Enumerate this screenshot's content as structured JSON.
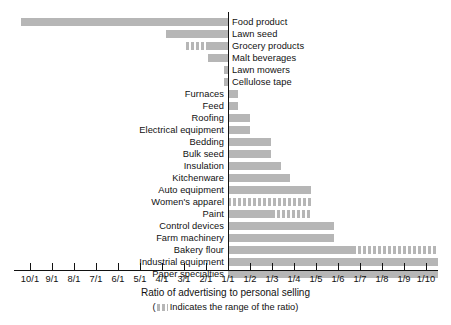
{
  "chart_data": {
    "type": "bar",
    "title": "",
    "xlabel": "Ratio of advertising to personal selling",
    "sublabel_prefix": "(",
    "sublabel_text": "Indicates the range of the ratio)",
    "ylabel": "",
    "orientation": "horizontal",
    "grid": false,
    "legend": "none",
    "axis_note": "Diverging horizontal bars about a central 1/1 axis; bars left of center indicate advertising-heavy ratios (n/1), bars right of center indicate selling-heavy ratios (1/n).",
    "xlim": [
      -10,
      10
    ],
    "tick_labels": [
      "10/1",
      "9/1",
      "8/1",
      "7/1",
      "6/1",
      "5/1",
      "4/1",
      "3/1",
      "2/1",
      "1/1",
      "1/2",
      "1/3",
      "1/4",
      "1/5",
      "1/6",
      "1/7",
      "1/8",
      "1/9",
      "1/10"
    ],
    "tick_values": [
      -10,
      -9,
      -8,
      -7,
      -6,
      -5,
      -4,
      -3,
      -2,
      1,
      2,
      3,
      4,
      5,
      6,
      7,
      8,
      9,
      10
    ],
    "series_name": "Ratio of advertising to personal selling",
    "colors": {
      "bar": "#b6b6b6",
      "axis": "#111111",
      "text": "#111111",
      "background": "#ffffff"
    },
    "categories": [
      "Food product",
      "Lawn seed",
      "Grocery products",
      "Malt beverages",
      "Lawn mowers",
      "Cellulose tape",
      "Furnaces",
      "Feed",
      "Roofing",
      "Electrical equipment",
      "Bedding",
      "Bulk seed",
      "Insulation",
      "Kitchenware",
      "Auto equipment",
      "Women's apparel",
      "Paint",
      "Control devices",
      "Farm machinery",
      "Bakery flour",
      "Industrial equipment",
      "Paper specialties"
    ],
    "bars": [
      {
        "category": "Food product",
        "side": "left",
        "label_position": "right",
        "value_label": "9.4/1",
        "px_start": 21,
        "px_end": 228,
        "segments": [
          {
            "style": "solid",
            "px_start": 21,
            "px_end": 228
          }
        ]
      },
      {
        "category": "Lawn seed",
        "side": "left",
        "label_position": "right",
        "value_label": "2.6/1",
        "px_start": 166,
        "px_end": 228,
        "segments": [
          {
            "style": "solid",
            "px_start": 166,
            "px_end": 228
          }
        ]
      },
      {
        "category": "Grocery products",
        "side": "left",
        "label_position": "right",
        "value_label": "1.9/1 range",
        "px_start": 186,
        "px_end": 228,
        "segments": [
          {
            "style": "striped",
            "px_start": 186,
            "px_end": 209
          },
          {
            "style": "solid",
            "px_start": 209,
            "px_end": 228
          }
        ]
      },
      {
        "category": "Malt beverages",
        "side": "left",
        "label_position": "right",
        "value_label": "1.9/1",
        "px_start": 208,
        "px_end": 228,
        "segments": [
          {
            "style": "solid",
            "px_start": 208,
            "px_end": 228
          }
        ]
      },
      {
        "category": "Lawn mowers",
        "side": "left",
        "label_position": "right",
        "value_label": "1.2/1",
        "px_start": 224,
        "px_end": 228,
        "segments": [
          {
            "style": "solid",
            "px_start": 224,
            "px_end": 228
          }
        ]
      },
      {
        "category": "Cellulose tape",
        "side": "left",
        "label_position": "right",
        "value_label": "1.2/1",
        "px_start": 224,
        "px_end": 228,
        "segments": [
          {
            "style": "solid",
            "px_start": 224,
            "px_end": 228
          }
        ]
      },
      {
        "category": "Furnaces",
        "side": "right",
        "label_position": "left",
        "value_label": "1/1.4",
        "px_start": 228,
        "px_end": 238,
        "segments": [
          {
            "style": "solid",
            "px_start": 228,
            "px_end": 238
          }
        ]
      },
      {
        "category": "Feed",
        "side": "right",
        "label_position": "left",
        "value_label": "1/1.4",
        "px_start": 228,
        "px_end": 238,
        "segments": [
          {
            "style": "solid",
            "px_start": 228,
            "px_end": 238
          }
        ]
      },
      {
        "category": "Roofing",
        "side": "right",
        "label_position": "left",
        "value_label": "1/2",
        "px_start": 228,
        "px_end": 250,
        "segments": [
          {
            "style": "solid",
            "px_start": 228,
            "px_end": 250
          }
        ]
      },
      {
        "category": "Electrical equipment",
        "side": "right",
        "label_position": "left",
        "value_label": "1/2",
        "px_start": 228,
        "px_end": 250,
        "segments": [
          {
            "style": "solid",
            "px_start": 228,
            "px_end": 250
          }
        ]
      },
      {
        "category": "Bedding",
        "side": "right",
        "label_position": "left",
        "value_label": "1/3",
        "px_start": 228,
        "px_end": 271,
        "segments": [
          {
            "style": "solid",
            "px_start": 228,
            "px_end": 271
          }
        ]
      },
      {
        "category": "Bulk seed",
        "side": "right",
        "label_position": "left",
        "value_label": "1/3",
        "px_start": 228,
        "px_end": 271,
        "segments": [
          {
            "style": "solid",
            "px_start": 228,
            "px_end": 271
          }
        ]
      },
      {
        "category": "Insulation",
        "side": "right",
        "label_position": "left",
        "value_label": "1/3.4",
        "px_start": 228,
        "px_end": 281,
        "segments": [
          {
            "style": "solid",
            "px_start": 228,
            "px_end": 281
          }
        ]
      },
      {
        "category": "Kitchenware",
        "side": "right",
        "label_position": "left",
        "value_label": "1/3.8",
        "px_start": 228,
        "px_end": 290,
        "segments": [
          {
            "style": "solid",
            "px_start": 228,
            "px_end": 290
          }
        ]
      },
      {
        "category": "Auto equipment",
        "side": "right",
        "label_position": "left",
        "value_label": "1/4.8",
        "px_start": 228,
        "px_end": 311,
        "segments": [
          {
            "style": "solid",
            "px_start": 228,
            "px_end": 311
          }
        ]
      },
      {
        "category": "Women's apparel",
        "side": "right",
        "label_position": "left",
        "value_label": "1/1 to 1/4.8 range",
        "px_start": 228,
        "px_end": 311,
        "segments": [
          {
            "style": "striped",
            "px_start": 228,
            "px_end": 311
          }
        ]
      },
      {
        "category": "Paint",
        "side": "right",
        "label_position": "left",
        "value_label": "1/3 to 1/4.8 range",
        "px_start": 228,
        "px_end": 311,
        "segments": [
          {
            "style": "solid",
            "px_start": 228,
            "px_end": 272
          },
          {
            "style": "striped",
            "px_start": 272,
            "px_end": 311
          }
        ]
      },
      {
        "category": "Control devices",
        "side": "right",
        "label_position": "left",
        "value_label": "1/5.8",
        "px_start": 228,
        "px_end": 334,
        "segments": [
          {
            "style": "solid",
            "px_start": 228,
            "px_end": 334
          }
        ]
      },
      {
        "category": "Farm machinery",
        "side": "right",
        "label_position": "left",
        "value_label": "1/5.8",
        "px_start": 228,
        "px_end": 334,
        "segments": [
          {
            "style": "solid",
            "px_start": 228,
            "px_end": 334
          }
        ]
      },
      {
        "category": "Bakery flour",
        "side": "right",
        "label_position": "left",
        "value_label": "1/6.7 to 1/10.5 range",
        "px_start": 228,
        "px_end": 438,
        "segments": [
          {
            "style": "solid",
            "px_start": 228,
            "px_end": 353
          },
          {
            "style": "striped",
            "px_start": 353,
            "px_end": 438
          }
        ]
      },
      {
        "category": "Industrial equipment",
        "side": "right",
        "label_position": "left",
        "value_label": "1/10.5",
        "px_start": 228,
        "px_end": 438,
        "segments": [
          {
            "style": "solid",
            "px_start": 228,
            "px_end": 438
          }
        ]
      },
      {
        "category": "Paper specialties",
        "side": "right",
        "label_position": "left",
        "value_label": "1/10.5",
        "px_start": 228,
        "px_end": 438,
        "segments": [
          {
            "style": "solid",
            "px_start": 228,
            "px_end": 438
          }
        ]
      }
    ]
  },
  "layout": {
    "zero_axis_px": 228,
    "row_height": 12,
    "first_row_top": 16,
    "axis_line_left": 14,
    "axis_line_right": 438,
    "tick_start_px": 30,
    "tick_spacing_px": 22
  }
}
